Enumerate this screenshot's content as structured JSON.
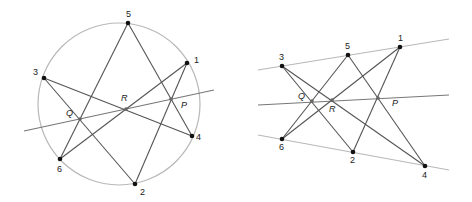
{
  "colors": {
    "segment": "#555555",
    "conic": "#b8b8b8",
    "pascal_line": "#777777",
    "point": "#111111",
    "intersection": "#666666",
    "background": "#ffffff"
  },
  "figures": [
    {
      "name": "circle-case",
      "conic": {
        "type": "circle",
        "cx": 119,
        "cy": 104,
        "r": 81
      },
      "points": [
        {
          "label": "1",
          "x": 187,
          "y": 63,
          "lx": 194,
          "ly": 63
        },
        {
          "label": "2",
          "x": 135,
          "y": 184,
          "lx": 140,
          "ly": 195
        },
        {
          "label": "3",
          "x": 44,
          "y": 78,
          "lx": 33,
          "ly": 75
        },
        {
          "label": "4",
          "x": 192,
          "y": 136,
          "lx": 196,
          "ly": 140
        },
        {
          "label": "5",
          "x": 128,
          "y": 23,
          "lx": 126,
          "ly": 17
        },
        {
          "label": "6",
          "x": 60,
          "y": 159,
          "lx": 57,
          "ly": 172
        }
      ],
      "segments": [
        [
          "5",
          "6"
        ],
        [
          "5",
          "4"
        ],
        [
          "3",
          "4"
        ],
        [
          "3",
          "2"
        ],
        [
          "1",
          "6"
        ],
        [
          "1",
          "2"
        ]
      ],
      "intersections": [
        {
          "label": "Q",
          "x": 80,
          "y": 119,
          "lx": 66,
          "ly": 116
        },
        {
          "label": "R",
          "x": 126,
          "y": 109,
          "lx": 121,
          "ly": 101
        },
        {
          "label": "P",
          "x": 171,
          "y": 99,
          "lx": 181,
          "ly": 108
        }
      ],
      "pascal_line": {
        "x1": 24,
        "y1": 131,
        "x2": 214,
        "y2": 90
      }
    },
    {
      "name": "two-lines-case",
      "conic": {
        "type": "line-pair",
        "lines": [
          {
            "x1": 258,
            "y1": 70,
            "x2": 449,
            "y2": 39
          },
          {
            "x1": 258,
            "y1": 135,
            "x2": 449,
            "y2": 170
          }
        ]
      },
      "points": [
        {
          "label": "1",
          "x": 400,
          "y": 47,
          "lx": 398,
          "ly": 41
        },
        {
          "label": "2",
          "x": 353,
          "y": 152,
          "lx": 350,
          "ly": 163
        },
        {
          "label": "3",
          "x": 282,
          "y": 66,
          "lx": 279,
          "ly": 60
        },
        {
          "label": "4",
          "x": 425,
          "y": 166,
          "lx": 422,
          "ly": 178
        },
        {
          "label": "5",
          "x": 348,
          "y": 55,
          "lx": 345,
          "ly": 49
        },
        {
          "label": "6",
          "x": 282,
          "y": 139,
          "lx": 279,
          "ly": 150
        }
      ],
      "segments": [
        [
          "5",
          "6"
        ],
        [
          "5",
          "4"
        ],
        [
          "3",
          "4"
        ],
        [
          "3",
          "2"
        ],
        [
          "1",
          "6"
        ],
        [
          "1",
          "2"
        ]
      ],
      "intersections": [
        {
          "label": "Q",
          "x": 312,
          "y": 101,
          "lx": 298,
          "ly": 99
        },
        {
          "label": "R",
          "x": 332,
          "y": 100,
          "lx": 329,
          "ly": 112
        },
        {
          "label": "P",
          "x": 378,
          "y": 98,
          "lx": 392,
          "ly": 106
        }
      ],
      "pascal_line": {
        "x1": 258,
        "y1": 105,
        "x2": 449,
        "y2": 95
      }
    }
  ]
}
